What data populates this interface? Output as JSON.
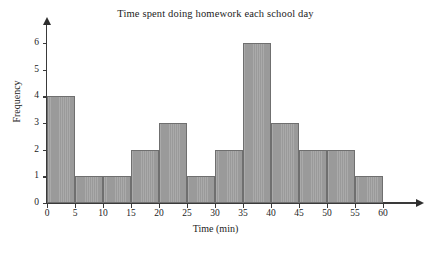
{
  "chart_data": {
    "type": "bar",
    "title": "Time spent doing homework each school day",
    "xlabel": "Time (min)",
    "ylabel": "Frequency",
    "xlim": [
      0,
      60
    ],
    "ylim": [
      0,
      6
    ],
    "grid": false,
    "legend": "none",
    "bin_width": 5,
    "bin_edges": [
      0,
      5,
      10,
      15,
      20,
      25,
      30,
      35,
      40,
      45,
      50,
      55,
      60
    ],
    "categories": [
      "0-5",
      "5-10",
      "10-15",
      "15-20",
      "20-25",
      "25-30",
      "30-35",
      "35-40",
      "40-45",
      "45-50",
      "50-55",
      "55-60"
    ],
    "values": [
      4,
      1,
      1,
      2,
      3,
      1,
      2,
      6,
      3,
      2,
      2,
      1
    ],
    "xticks": [
      0,
      5,
      10,
      15,
      20,
      25,
      30,
      35,
      40,
      45,
      50,
      55,
      60
    ],
    "xtick_labels": [
      "0",
      "5",
      "10",
      "15",
      "20",
      "25",
      "30",
      "35",
      "40",
      "45",
      "50",
      "55",
      "60"
    ],
    "yticks": [
      0,
      1,
      2,
      3,
      4,
      5,
      6
    ],
    "ytick_labels": [
      "0",
      "1",
      "2",
      "3",
      "4",
      "5",
      "6"
    ],
    "bar_fill_color": "#9a9a9a",
    "bar_edge_color": "#6f6f6f",
    "axis_color": "#3a3a3a",
    "background_color": "#ffffff"
  }
}
